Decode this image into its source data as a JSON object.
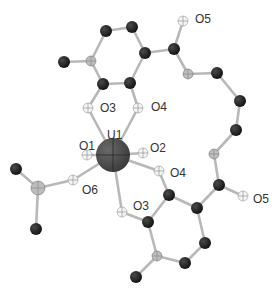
{
  "diagram": {
    "type": "molecular-structure",
    "colors": {
      "carbon": "#1e1e1e",
      "oxygen": "#f4f4f4",
      "hatched": "#bdbdbd",
      "uranium": "#4a4a4a",
      "bond": "#b8b8b8",
      "label": "#333333"
    },
    "labels": [
      {
        "id": "O5-top",
        "text": "O5",
        "x": 195,
        "y": 23
      },
      {
        "id": "O3-top",
        "text": "O3",
        "x": 100,
        "y": 112
      },
      {
        "id": "O4-top",
        "text": "O4",
        "x": 151,
        "y": 111
      },
      {
        "id": "U1",
        "text": "U1",
        "x": 107,
        "y": 139
      },
      {
        "id": "O1",
        "text": "O1",
        "x": 79,
        "y": 150
      },
      {
        "id": "O2",
        "text": "O2",
        "x": 150,
        "y": 152
      },
      {
        "id": "O4-bottom",
        "text": "O4",
        "x": 170,
        "y": 177
      },
      {
        "id": "O6",
        "text": "O6",
        "x": 82,
        "y": 194
      },
      {
        "id": "O3-bottom",
        "text": "O3",
        "x": 133,
        "y": 210
      },
      {
        "id": "O5-bottom",
        "text": "O5",
        "x": 253,
        "y": 203
      }
    ],
    "atoms": [
      {
        "id": "a1",
        "kind": "carbon",
        "x": 106,
        "y": 31,
        "r": 6
      },
      {
        "id": "a2",
        "kind": "carbon",
        "x": 132,
        "y": 27,
        "r": 6
      },
      {
        "id": "a3",
        "kind": "carbon",
        "x": 145,
        "y": 53,
        "r": 6
      },
      {
        "id": "a4",
        "kind": "hatched",
        "x": 91,
        "y": 61,
        "r": 5
      },
      {
        "id": "a5",
        "kind": "carbon",
        "x": 64,
        "y": 62,
        "r": 6
      },
      {
        "id": "a6",
        "kind": "carbon",
        "x": 103,
        "y": 84,
        "r": 6
      },
      {
        "id": "a7",
        "kind": "carbon",
        "x": 130,
        "y": 83,
        "r": 6
      },
      {
        "id": "a8",
        "kind": "oxygen",
        "x": 88,
        "y": 108,
        "r": 5
      },
      {
        "id": "a9",
        "kind": "oxygen",
        "x": 138,
        "y": 108,
        "r": 5
      },
      {
        "id": "a10",
        "kind": "carbon",
        "x": 174,
        "y": 49,
        "r": 6
      },
      {
        "id": "a11",
        "kind": "oxygen",
        "x": 183,
        "y": 21,
        "r": 5
      },
      {
        "id": "a12",
        "kind": "hatched",
        "x": 188,
        "y": 74,
        "r": 5
      },
      {
        "id": "a13",
        "kind": "carbon",
        "x": 217,
        "y": 73,
        "r": 6
      },
      {
        "id": "a14",
        "kind": "carbon",
        "x": 240,
        "y": 101,
        "r": 6
      },
      {
        "id": "a15",
        "kind": "carbon",
        "x": 236,
        "y": 130,
        "r": 6
      },
      {
        "id": "a16",
        "kind": "hatched",
        "x": 214,
        "y": 154,
        "r": 5
      },
      {
        "id": "a17",
        "kind": "carbon",
        "x": 219,
        "y": 185,
        "r": 6
      },
      {
        "id": "a18",
        "kind": "oxygen",
        "x": 243,
        "y": 196,
        "r": 5
      },
      {
        "id": "a19",
        "kind": "oxygen",
        "x": 159,
        "y": 171,
        "r": 5
      },
      {
        "id": "a20",
        "kind": "carbon",
        "x": 169,
        "y": 195,
        "r": 6
      },
      {
        "id": "a21",
        "kind": "carbon",
        "x": 197,
        "y": 208,
        "r": 6
      },
      {
        "id": "a22",
        "kind": "carbon",
        "x": 205,
        "y": 243,
        "r": 6
      },
      {
        "id": "a23",
        "kind": "carbon",
        "x": 185,
        "y": 263,
        "r": 6
      },
      {
        "id": "a24",
        "kind": "hatched",
        "x": 157,
        "y": 256,
        "r": 5
      },
      {
        "id": "a25",
        "kind": "carbon",
        "x": 148,
        "y": 222,
        "r": 6
      },
      {
        "id": "a26",
        "kind": "carbon",
        "x": 136,
        "y": 277,
        "r": 6
      },
      {
        "id": "a27",
        "kind": "oxygen",
        "x": 122,
        "y": 212,
        "r": 5
      },
      {
        "id": "a28",
        "kind": "oxygen",
        "x": 87,
        "y": 155,
        "r": 5
      },
      {
        "id": "a29",
        "kind": "oxygen",
        "x": 143,
        "y": 153,
        "r": 5
      },
      {
        "id": "a30",
        "kind": "oxygen",
        "x": 73,
        "y": 180,
        "r": 5
      },
      {
        "id": "a31",
        "kind": "hatched",
        "x": 38,
        "y": 188,
        "r": 7
      },
      {
        "id": "a32",
        "kind": "carbon",
        "x": 16,
        "y": 169,
        "r": 6
      },
      {
        "id": "a33",
        "kind": "carbon",
        "x": 36,
        "y": 229,
        "r": 6
      },
      {
        "id": "U1",
        "kind": "uranium",
        "x": 113,
        "y": 155,
        "r": 17
      }
    ],
    "bonds": [
      [
        "a1",
        "a2"
      ],
      [
        "a2",
        "a3"
      ],
      [
        "a1",
        "a4"
      ],
      [
        "a4",
        "a5"
      ],
      [
        "a4",
        "a6"
      ],
      [
        "a6",
        "a7"
      ],
      [
        "a7",
        "a3"
      ],
      [
        "a6",
        "a8"
      ],
      [
        "a7",
        "a9"
      ],
      [
        "a3",
        "a10"
      ],
      [
        "a10",
        "a11"
      ],
      [
        "a10",
        "a12"
      ],
      [
        "a12",
        "a13"
      ],
      [
        "a13",
        "a14"
      ],
      [
        "a14",
        "a15"
      ],
      [
        "a15",
        "a16"
      ],
      [
        "a16",
        "a17"
      ],
      [
        "a17",
        "a18"
      ],
      [
        "a17",
        "a21"
      ],
      [
        "a21",
        "a20"
      ],
      [
        "a21",
        "a22"
      ],
      [
        "a22",
        "a23"
      ],
      [
        "a23",
        "a24"
      ],
      [
        "a24",
        "a25"
      ],
      [
        "a25",
        "a20"
      ],
      [
        "a24",
        "a26"
      ],
      [
        "a20",
        "a19"
      ],
      [
        "a25",
        "a27"
      ],
      [
        "a31",
        "a32"
      ],
      [
        "a31",
        "a33"
      ],
      [
        "a31",
        "a30"
      ],
      [
        "U1",
        "a8"
      ],
      [
        "U1",
        "a9"
      ],
      [
        "U1",
        "a28"
      ],
      [
        "U1",
        "a29"
      ],
      [
        "U1",
        "a30"
      ],
      [
        "U1",
        "a27"
      ],
      [
        "U1",
        "a19"
      ]
    ]
  }
}
